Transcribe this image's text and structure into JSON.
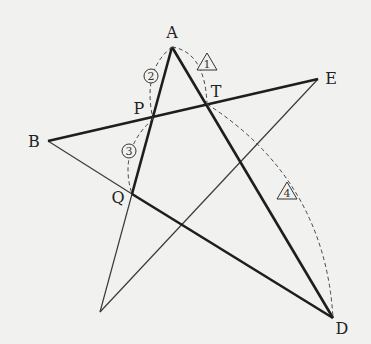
{
  "diagram": {
    "type": "star-pentagram-geometry",
    "points": {
      "A": {
        "label": "A",
        "x": 172,
        "y": 47,
        "lx": 172,
        "ly": 38
      },
      "B": {
        "label": "B",
        "x": 48,
        "y": 141,
        "lx": 34,
        "ly": 147
      },
      "C": {
        "label": "",
        "x": 100,
        "y": 312
      },
      "D": {
        "label": "D",
        "x": 333,
        "y": 318,
        "lx": 342,
        "ly": 334
      },
      "E": {
        "label": "E",
        "x": 318,
        "y": 79,
        "lx": 330,
        "ly": 84
      },
      "P": {
        "label": "P",
        "x": 153,
        "y": 119,
        "lx": 138,
        "ly": 114
      },
      "Q": {
        "label": "Q",
        "x": 132,
        "y": 194,
        "lx": 118,
        "ly": 203
      },
      "T": {
        "label": "T",
        "x": 207,
        "y": 104,
        "lx": 215,
        "ly": 97
      }
    },
    "markers": [
      {
        "id": "m1",
        "shape": "triangle",
        "text": "1",
        "x": 207,
        "y": 61
      },
      {
        "id": "m2",
        "shape": "circle",
        "text": "2",
        "x": 151,
        "y": 76
      },
      {
        "id": "m3",
        "shape": "circle",
        "text": "3",
        "x": 129,
        "y": 151
      },
      {
        "id": "m4",
        "shape": "triangle",
        "text": "4",
        "x": 287,
        "y": 190
      }
    ],
    "colors": {
      "background": "#f1f1ef",
      "stroke": "#1e1e1e",
      "thin": "#3a3a3a",
      "dash": "#444444"
    }
  }
}
